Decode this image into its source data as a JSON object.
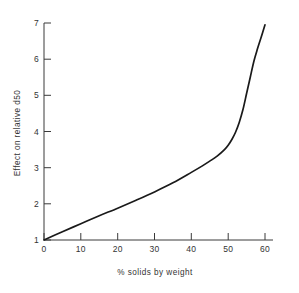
{
  "chart_data": {
    "type": "line",
    "title": "",
    "xlabel": "% solids by weight",
    "ylabel": "Effect on relative d50",
    "xlim": [
      0,
      62
    ],
    "ylim": [
      1,
      7.2
    ],
    "grid": false,
    "legend": null,
    "xticks": [
      0,
      10,
      20,
      30,
      40,
      50,
      60
    ],
    "xticklabels": [
      "0",
      "10",
      "20",
      "30",
      "40",
      "50",
      "60"
    ],
    "yticks": [
      1,
      2,
      3,
      4,
      5,
      6,
      7
    ],
    "yticklabels": [
      "1",
      "2",
      "3",
      "4",
      "5",
      "6",
      "7"
    ],
    "series": [
      {
        "name": "Effect on relative d50",
        "x": [
          0,
          5,
          10,
          15,
          20,
          25,
          30,
          35,
          40,
          43,
          45,
          47,
          49,
          50,
          51,
          52,
          53,
          54,
          55,
          56,
          57,
          58,
          59,
          60
        ],
        "values": [
          1.0,
          1.23,
          1.45,
          1.67,
          1.88,
          2.1,
          2.33,
          2.58,
          2.87,
          3.05,
          3.18,
          3.32,
          3.5,
          3.62,
          3.78,
          3.98,
          4.25,
          4.6,
          5.05,
          5.5,
          5.95,
          6.3,
          6.62,
          6.95
        ]
      }
    ]
  },
  "axes": {
    "ytitle": "Effect on relative d50",
    "xtitle": "% solids by weight"
  }
}
